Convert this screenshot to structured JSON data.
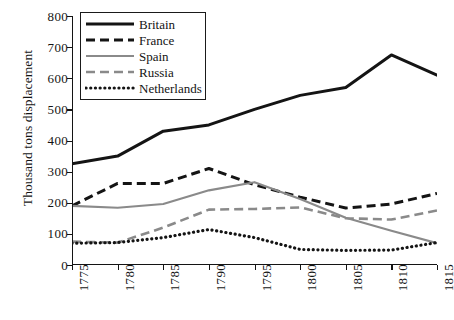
{
  "chart_data": {
    "type": "line",
    "title": "",
    "xlabel": "",
    "ylabel": "Thousand tons displacement",
    "x": [
      1775,
      1780,
      1785,
      1790,
      1795,
      1800,
      1805,
      1810,
      1815
    ],
    "categories": [
      "1775",
      "1780",
      "1785",
      "1790",
      "1795",
      "1800",
      "1805",
      "1810",
      "1815"
    ],
    "xlim": [
      1775,
      1815
    ],
    "ylim": [
      0,
      800
    ],
    "yticks": [
      0,
      100,
      200,
      300,
      400,
      500,
      600,
      700,
      800
    ],
    "ytick_labels": [
      "0",
      "100",
      "200",
      "300",
      "400",
      "500",
      "600",
      "700",
      "800"
    ],
    "grid": false,
    "legend_position": "top-left",
    "series": [
      {
        "name": "Britain",
        "style": "solid",
        "color": "#141414",
        "width": 3.0,
        "values": [
          325,
          350,
          430,
          450,
          500,
          545,
          570,
          675,
          610
        ]
      },
      {
        "name": "France",
        "style": "dashed",
        "color": "#141414",
        "width": 3.0,
        "values": [
          190,
          262,
          262,
          310,
          258,
          218,
          183,
          196,
          230
        ]
      },
      {
        "name": "Spain",
        "style": "solid",
        "color": "#8a8a8a",
        "width": 2.2,
        "values": [
          190,
          184,
          196,
          240,
          266,
          212,
          152,
          110,
          70
        ]
      },
      {
        "name": "Russia",
        "style": "dashed",
        "color": "#8a8a8a",
        "width": 2.6,
        "values": [
          75,
          72,
          120,
          178,
          180,
          185,
          150,
          146,
          175
        ]
      },
      {
        "name": "Netherlands",
        "style": "dotted",
        "color": "#141414",
        "width": 3.2,
        "values": [
          70,
          72,
          88,
          114,
          88,
          50,
          47,
          48,
          72
        ]
      }
    ]
  },
  "legend": {
    "entries": [
      {
        "label": "Britain"
      },
      {
        "label": "France"
      },
      {
        "label": "Spain"
      },
      {
        "label": "Russia"
      },
      {
        "label": "Netherlands"
      }
    ]
  },
  "axes": {
    "y_title": "Thousand tons displacement"
  }
}
